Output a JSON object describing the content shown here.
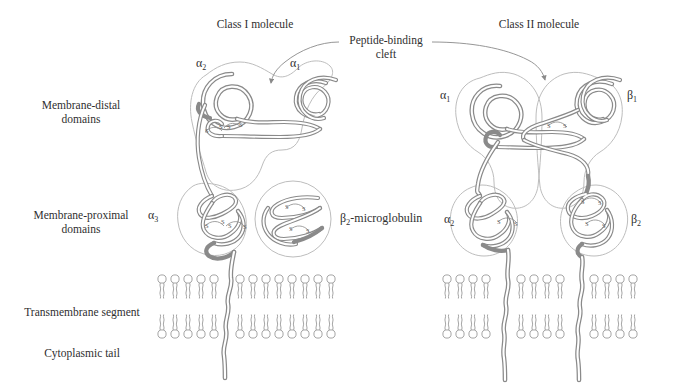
{
  "figure": {
    "type": "biological-diagram",
    "background_color": "#ffffff",
    "ribbon_color": "#8a8a8a",
    "outline_color": "#b9b9b9",
    "text_color": "#2f2f2f"
  },
  "titles": {
    "class_i": "Class I molecule",
    "class_ii": "Class II molecule"
  },
  "callout": {
    "line1": "Peptide-binding",
    "line2": "cleft"
  },
  "row_labels": [
    {
      "id": "membrane-distal",
      "line1": "Membrane-distal",
      "line2": "domains"
    },
    {
      "id": "membrane-proximal",
      "line1": "Membrane-proximal",
      "line2": "domains"
    },
    {
      "id": "transmembrane",
      "line1": "Transmembrane segment",
      "line2": ""
    },
    {
      "id": "cytoplasmic",
      "line1": "Cytoplasmic tail",
      "line2": ""
    }
  ],
  "class_i_domains": [
    {
      "id": "alpha2",
      "greek": "α",
      "sub": "2"
    },
    {
      "id": "alpha1",
      "greek": "α",
      "sub": "1"
    },
    {
      "id": "alpha3",
      "greek": "α",
      "sub": "3"
    }
  ],
  "class_i_beta2m": {
    "greek": "β",
    "sub": "2",
    "rest": "-microglobulin"
  },
  "class_ii_domains": [
    {
      "id": "alpha1",
      "greek": "α",
      "sub": "1"
    },
    {
      "id": "beta1",
      "greek": "β",
      "sub": "1"
    },
    {
      "id": "alpha2",
      "greek": "α",
      "sub": "2"
    },
    {
      "id": "beta2",
      "greek": "β",
      "sub": "2"
    }
  ],
  "disulfide_label": "S–S",
  "membrane": {
    "leaflets": 2,
    "class_i_lipids_per_leaflet": 13,
    "class_ii_lipids_per_leaflet": 14
  }
}
